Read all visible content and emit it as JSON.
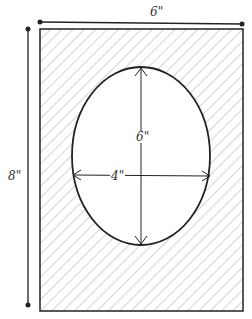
{
  "diagram": {
    "labels": {
      "frame_width": "6\"",
      "frame_height": "8\"",
      "oval_height": "6\"",
      "oval_width": "4\""
    },
    "colors": {
      "line": "#222222",
      "hatch": "#999999",
      "shade": "#dddddd"
    }
  }
}
